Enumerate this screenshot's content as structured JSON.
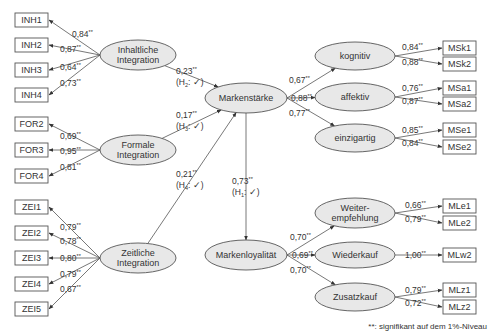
{
  "diagram": {
    "type": "structural-equation-model",
    "colors": {
      "ellipse_fill": "#e8e8e8",
      "stroke": "#555555",
      "text": "#333333"
    },
    "constructs": [
      {
        "id": "inh",
        "label": [
          "Inhaltliche",
          "Integration"
        ],
        "cx": 138,
        "cy": 55,
        "rx": 38,
        "ry": 15
      },
      {
        "id": "for",
        "label": [
          "Formale",
          "Integration"
        ],
        "cx": 138,
        "cy": 150,
        "rx": 38,
        "ry": 15
      },
      {
        "id": "zei",
        "label": [
          "Zeitliche",
          "Integration"
        ],
        "cx": 138,
        "cy": 258,
        "rx": 38,
        "ry": 15
      },
      {
        "id": "ms",
        "label": [
          "Markenstärke"
        ],
        "cx": 246,
        "cy": 98,
        "rx": 41,
        "ry": 15
      },
      {
        "id": "ml",
        "label": [
          "Markenloyalität"
        ],
        "cx": 246,
        "cy": 255,
        "rx": 41,
        "ry": 15
      },
      {
        "id": "kog",
        "label": [
          "kognitiv"
        ],
        "cx": 355,
        "cy": 56,
        "rx": 40,
        "ry": 14
      },
      {
        "id": "aff",
        "label": [
          "affektiv"
        ],
        "cx": 355,
        "cy": 97,
        "rx": 40,
        "ry": 14
      },
      {
        "id": "ein",
        "label": [
          "einzigartig"
        ],
        "cx": 355,
        "cy": 138,
        "rx": 40,
        "ry": 14
      },
      {
        "id": "wei",
        "label": [
          "Weiter-",
          "empfehlung"
        ],
        "cx": 355,
        "cy": 213,
        "rx": 40,
        "ry": 15
      },
      {
        "id": "wie",
        "label": [
          "Wiederkauf"
        ],
        "cx": 355,
        "cy": 255,
        "rx": 40,
        "ry": 13
      },
      {
        "id": "zus",
        "label": [
          "Zusatzkauf"
        ],
        "cx": 355,
        "cy": 297,
        "rx": 40,
        "ry": 14
      }
    ],
    "indicators": [
      {
        "id": "INH1",
        "x": 15,
        "y": 13,
        "w": 33,
        "h": 14,
        "from": "inh",
        "loading": "0,84",
        "lx": 72,
        "ly": 37
      },
      {
        "id": "INH2",
        "x": 15,
        "y": 38,
        "w": 33,
        "h": 14,
        "from": "inh",
        "loading": "0,87",
        "lx": 60,
        "ly": 52
      },
      {
        "id": "INH3",
        "x": 15,
        "y": 63,
        "w": 33,
        "h": 14,
        "from": "inh",
        "loading": "0,64",
        "lx": 60,
        "ly": 70
      },
      {
        "id": "INH4",
        "x": 15,
        "y": 88,
        "w": 33,
        "h": 14,
        "from": "inh",
        "loading": "0,73",
        "lx": 60,
        "ly": 86
      },
      {
        "id": "FOR2",
        "x": 15,
        "y": 117,
        "w": 33,
        "h": 14,
        "from": "for",
        "loading": "0,69",
        "lx": 60,
        "ly": 139
      },
      {
        "id": "FOR3",
        "x": 15,
        "y": 143,
        "w": 33,
        "h": 14,
        "from": "for",
        "loading": "0,95",
        "lx": 60,
        "ly": 154
      },
      {
        "id": "FOR4",
        "x": 15,
        "y": 169,
        "w": 33,
        "h": 14,
        "from": "for",
        "loading": "0,81",
        "lx": 60,
        "ly": 170
      },
      {
        "id": "ZEI1",
        "x": 15,
        "y": 200,
        "w": 33,
        "h": 14,
        "from": "zei",
        "loading": "0,79",
        "lx": 60,
        "ly": 230
      },
      {
        "id": "ZEI2",
        "x": 15,
        "y": 226,
        "w": 33,
        "h": 14,
        "from": "zei",
        "loading": "0,78",
        "lx": 60,
        "ly": 244
      },
      {
        "id": "ZEI3",
        "x": 15,
        "y": 251,
        "w": 33,
        "h": 14,
        "from": "zei",
        "loading": "0,80",
        "lx": 60,
        "ly": 261
      },
      {
        "id": "ZEI4",
        "x": 15,
        "y": 277,
        "w": 33,
        "h": 14,
        "from": "zei",
        "loading": "0,79",
        "lx": 60,
        "ly": 277
      },
      {
        "id": "ZEI5",
        "x": 15,
        "y": 302,
        "w": 33,
        "h": 14,
        "from": "zei",
        "loading": "0,67",
        "lx": 60,
        "ly": 292
      },
      {
        "id": "MSk1",
        "x": 443,
        "y": 41,
        "w": 33,
        "h": 14,
        "from": "kog",
        "loading": "0,84",
        "lx": 402,
        "ly": 50
      },
      {
        "id": "MSk2",
        "x": 443,
        "y": 57,
        "w": 33,
        "h": 14,
        "from": "kog",
        "loading": "0,88",
        "lx": 402,
        "ly": 65
      },
      {
        "id": "MSa1",
        "x": 443,
        "y": 81,
        "w": 33,
        "h": 14,
        "from": "aff",
        "loading": "0,76",
        "lx": 402,
        "ly": 91
      },
      {
        "id": "MSa2",
        "x": 443,
        "y": 97,
        "w": 33,
        "h": 14,
        "from": "aff",
        "loading": "0,87",
        "lx": 402,
        "ly": 104
      },
      {
        "id": "MSe1",
        "x": 443,
        "y": 123,
        "w": 33,
        "h": 14,
        "from": "ein",
        "loading": "0,85",
        "lx": 402,
        "ly": 133
      },
      {
        "id": "MSe2",
        "x": 443,
        "y": 140,
        "w": 33,
        "h": 14,
        "from": "ein",
        "loading": "0,84",
        "lx": 402,
        "ly": 146
      },
      {
        "id": "MLe1",
        "x": 443,
        "y": 199,
        "w": 33,
        "h": 14,
        "from": "wei",
        "loading": "0,66",
        "lx": 405,
        "ly": 208
      },
      {
        "id": "MLe2",
        "x": 443,
        "y": 216,
        "w": 33,
        "h": 14,
        "from": "wei",
        "loading": "0,79",
        "lx": 405,
        "ly": 222
      },
      {
        "id": "MLw2",
        "x": 443,
        "y": 248,
        "w": 33,
        "h": 14,
        "from": "wie",
        "loading": "1,00",
        "lx": 405,
        "ly": 258
      },
      {
        "id": "MLz1",
        "x": 443,
        "y": 283,
        "w": 33,
        "h": 14,
        "from": "zus",
        "loading": "0,79",
        "lx": 405,
        "ly": 293
      },
      {
        "id": "MLz2",
        "x": 443,
        "y": 300,
        "w": 33,
        "h": 14,
        "from": "zus",
        "loading": "0,72",
        "lx": 405,
        "ly": 306
      }
    ],
    "paths": [
      {
        "from": "inh",
        "to": "ms",
        "coef": "0,23",
        "hyp": "H",
        "sub": "2",
        "lx": 176,
        "ly": 74
      },
      {
        "from": "for",
        "to": "ms",
        "coef": "0,17",
        "hyp": "H",
        "sub": "3",
        "lx": 176,
        "ly": 118
      },
      {
        "from": "zei",
        "to": "ms",
        "coef": "0,21",
        "hyp": "H",
        "sub": "4",
        "lx": 176,
        "ly": 177
      },
      {
        "from": "ms",
        "to": "ml",
        "coef": "0,73",
        "hyp": "H",
        "sub": "1",
        "lx": 232,
        "ly": 184
      }
    ],
    "second_order": [
      {
        "from": "ms",
        "to": "kog",
        "coef": "0,67",
        "lx": 289,
        "ly": 83
      },
      {
        "from": "ms",
        "to": "aff",
        "coef": "0,88",
        "lx": 291,
        "ly": 101
      },
      {
        "from": "ms",
        "to": "ein",
        "coef": "0,77",
        "lx": 289,
        "ly": 116
      },
      {
        "from": "ml",
        "to": "wei",
        "coef": "0,70",
        "lx": 290,
        "ly": 240
      },
      {
        "from": "ml",
        "to": "wie",
        "coef": "0,69",
        "lx": 292,
        "ly": 258
      },
      {
        "from": "ml",
        "to": "zus",
        "coef": "0,70",
        "lx": 290,
        "ly": 273
      }
    ],
    "significance_marker": "**",
    "check_mark": "✓",
    "footnote": "**: signifikant auf dem 1%-Niveau"
  }
}
